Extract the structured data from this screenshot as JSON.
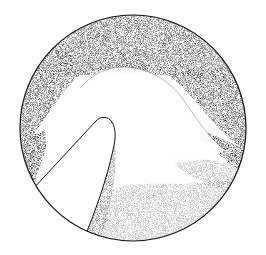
{
  "figure": {
    "description": "Stippled circular endoscopic-style illustration showing a tissue fold with a probe instrument entering from lower left",
    "colors": {
      "ink": "#111111",
      "paper": "#ffffff"
    },
    "circle": {
      "cx": 133,
      "cy": 128,
      "r": 113
    },
    "probe": {
      "label": ""
    }
  }
}
